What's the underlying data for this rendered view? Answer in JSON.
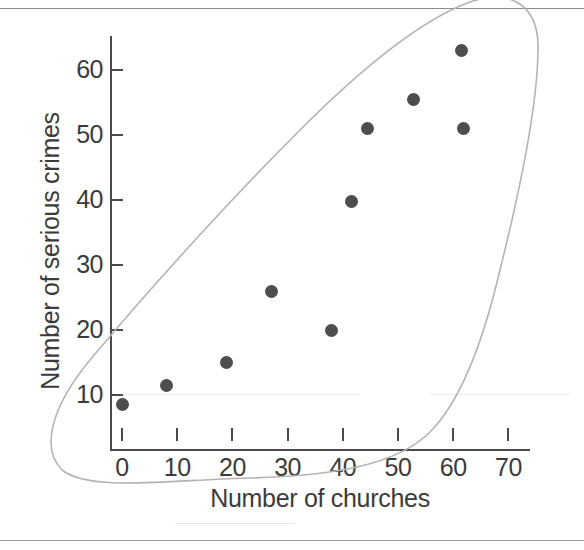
{
  "chart_data": {
    "type": "scatter",
    "title": "",
    "xlabel": "Number of churches",
    "ylabel": "Number of serious crimes",
    "xlim": [
      0,
      72
    ],
    "ylim": [
      4,
      66
    ],
    "xticks": [
      0,
      10,
      20,
      30,
      40,
      50,
      60,
      70
    ],
    "yticks": [
      10,
      20,
      30,
      40,
      50,
      60
    ],
    "grid": false,
    "legend": null,
    "point_color": "#4d4d4d",
    "axis_color": "#4a4a4a",
    "annotation_color": "#b0b0b0",
    "annotations": [
      {
        "name": "correlation-ellipse",
        "shape": "ellipse",
        "description": "hand-drawn oval enclosing all data points along the positive trend"
      }
    ],
    "points": [
      {
        "x": 0,
        "y": 8.5
      },
      {
        "x": 8,
        "y": 11.5
      },
      {
        "x": 19,
        "y": 15
      },
      {
        "x": 27,
        "y": 26
      },
      {
        "x": 38,
        "y": 20
      },
      {
        "x": 41.5,
        "y": 39.8
      },
      {
        "x": 44.5,
        "y": 51
      },
      {
        "x": 52.8,
        "y": 55.5
      },
      {
        "x": 61.8,
        "y": 51
      },
      {
        "x": 61.5,
        "y": 63
      }
    ]
  },
  "axis": {
    "x_title": "Number of churches",
    "y_title": "Number of serious crimes",
    "x_tick_labels": [
      "0",
      "10",
      "20",
      "30",
      "40",
      "50",
      "60",
      "70"
    ],
    "y_tick_labels": [
      "10",
      "20",
      "30",
      "40",
      "50",
      "60"
    ]
  }
}
